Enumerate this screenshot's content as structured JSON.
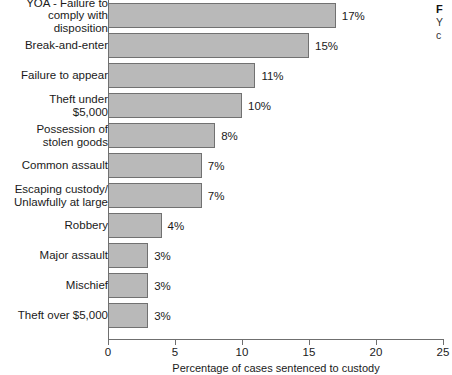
{
  "chart_data": {
    "type": "bar",
    "orientation": "horizontal",
    "title": "",
    "xlabel": "Percentage of cases sentenced to custody",
    "ylabel": "",
    "xlim": [
      0,
      25
    ],
    "xticks": [
      0,
      5,
      10,
      15,
      20,
      25
    ],
    "xtick_labels": [
      "0",
      "5",
      "10",
      "15",
      "20",
      "25"
    ],
    "grid": false,
    "legend": "none",
    "bar_color": "#b9b9b9",
    "bar_border_color": "#717171",
    "axis_color": "#6f6f6f",
    "categories": [
      "YOA - Failure to\ncomply with disposition",
      "Break-and-enter",
      "Failure to appear",
      "Theft under $5,000",
      "Possession of\nstolen goods",
      "Common assault",
      "Escaping custody/\nUnlawfully at large",
      "Robbery",
      "Major assault",
      "Mischief",
      "Theft over $5,000"
    ],
    "values": [
      17,
      15,
      11,
      10,
      8,
      7,
      7,
      4,
      3,
      3,
      3
    ],
    "value_labels": [
      "17%",
      "15%",
      "11%",
      "10%",
      "8%",
      "7%",
      "7%",
      "4%",
      "3%",
      "3%",
      "3%"
    ]
  },
  "side_caption": {
    "title": "F",
    "line1": "Y",
    "line2": "c"
  }
}
